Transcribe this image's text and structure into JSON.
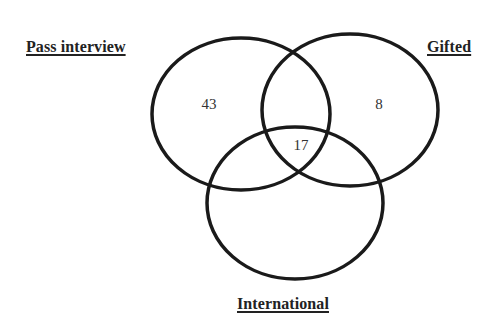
{
  "diagram": {
    "type": "venn",
    "sets": [
      {
        "id": "pass",
        "label": "Pass interview"
      },
      {
        "id": "gifted",
        "label": "Gifted"
      },
      {
        "id": "international",
        "label": "International"
      }
    ],
    "regions": {
      "pass_only": "43",
      "gifted_only": "8",
      "all_three": "17"
    },
    "style": {
      "stroke_color": "#1a1a1a",
      "stroke_width": 3.5,
      "background": "#ffffff"
    }
  }
}
